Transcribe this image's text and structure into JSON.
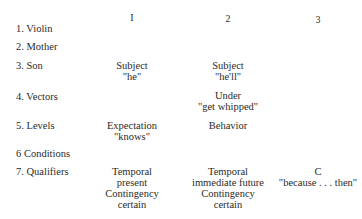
{
  "columns": [
    "I",
    "2",
    "3"
  ],
  "rows": [
    {
      "label": "1. Violin",
      "cells": [
        [],
        [],
        []
      ]
    },
    {
      "label": "2. Mother",
      "cells": [
        [],
        [],
        []
      ]
    },
    {
      "label": "3. Son",
      "cells": [
        [
          "Subject",
          "\"he\""
        ],
        [
          "Subject",
          "\"he'll\""
        ],
        []
      ]
    },
    {
      "label": "4. Vectors",
      "cells": [
        [],
        [
          "Under",
          "\"get whipped\""
        ],
        []
      ]
    },
    {
      "label": "5. Levels",
      "cells": [
        [
          "Expectation",
          "\"knows\""
        ],
        [
          "Behavior"
        ],
        []
      ]
    },
    {
      "label": "6 Conditions",
      "cells": [
        [],
        [],
        []
      ]
    },
    {
      "label": "7. Qualifiers",
      "cells": [
        [
          "Temporal",
          "present",
          "Contingency",
          "certain"
        ],
        [
          "Temporal",
          "immediate future",
          "Contingency",
          "certain"
        ],
        [
          "C",
          "\"because . . . then\""
        ]
      ]
    }
  ]
}
